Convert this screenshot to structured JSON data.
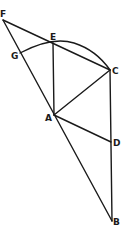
{
  "diagram": {
    "points": {
      "F": {
        "label": "F",
        "x": 3,
        "y": 20,
        "lx": 0,
        "ly": 17
      },
      "G": {
        "label": "G",
        "x": 20,
        "y": 53,
        "lx": 11,
        "ly": 59
      },
      "E": {
        "label": "E",
        "x": 53,
        "y": 43,
        "lx": 50,
        "ly": 40
      },
      "C": {
        "label": "C",
        "x": 110,
        "y": 70,
        "lx": 112,
        "ly": 74
      },
      "A": {
        "label": "A",
        "x": 54,
        "y": 115,
        "lx": 45,
        "ly": 121
      },
      "D": {
        "label": "D",
        "x": 111,
        "y": 142,
        "lx": 113,
        "ly": 146
      },
      "B": {
        "label": "B",
        "x": 112,
        "y": 221,
        "lx": 113,
        "ly": 225
      }
    },
    "segments": [
      [
        "F",
        "C"
      ],
      [
        "F",
        "B"
      ],
      [
        "E",
        "A"
      ],
      [
        "A",
        "C"
      ],
      [
        "A",
        "D"
      ],
      [
        "C",
        "B"
      ]
    ],
    "arc": {
      "from": "G",
      "through": "E",
      "to": "C"
    }
  }
}
